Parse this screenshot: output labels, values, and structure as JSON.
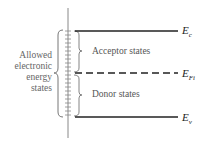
{
  "diagram": {
    "left_label_lines": [
      "Allowed",
      "electronic",
      "energy",
      "states"
    ],
    "regions": {
      "acceptor": "Acceptor states",
      "donor": "Donor states"
    },
    "levels": {
      "conduction": {
        "symbol": "E",
        "sub": "c"
      },
      "intrinsic_fermi": {
        "symbol": "E",
        "sub": "Fi"
      },
      "valence": {
        "symbol": "E",
        "sub": "v"
      }
    },
    "colors": {
      "line": "#222222",
      "text": "#555555",
      "axis": "#888888"
    }
  }
}
